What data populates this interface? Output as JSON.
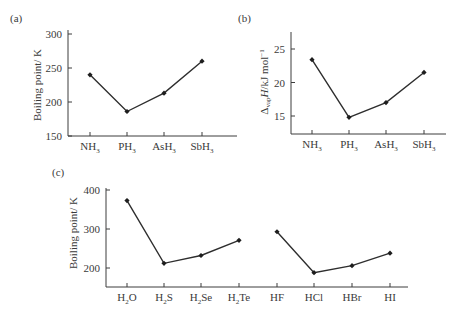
{
  "chart_data": [
    {
      "panel": "(a)",
      "type": "line",
      "categories": [
        "NH3",
        "PH3",
        "AsH3",
        "SbH3"
      ],
      "category_labels": [
        {
          "base": "NH",
          "sub": "3"
        },
        {
          "base": "PH",
          "sub": "3"
        },
        {
          "base": "AsH",
          "sub": "3"
        },
        {
          "base": "SbH",
          "sub": "3"
        }
      ],
      "values": [
        240,
        186,
        213,
        260
      ],
      "ylabel": "Boiling point / K",
      "xlabel": "",
      "yticks": [
        "150",
        "200",
        "250",
        "300"
      ],
      "ylim": [
        150,
        300
      ],
      "grid": false,
      "marker": "diamond"
    },
    {
      "panel": "(b)",
      "type": "line",
      "categories": [
        "NH3",
        "PH3",
        "AsH3",
        "SbH3"
      ],
      "category_labels": [
        {
          "base": "NH",
          "sub": "3"
        },
        {
          "base": "PH",
          "sub": "3"
        },
        {
          "base": "AsH",
          "sub": "3"
        },
        {
          "base": "SbH",
          "sub": "3"
        }
      ],
      "values": [
        23.4,
        14.8,
        17.0,
        21.5
      ],
      "ylabel": "ΔvapH / kJ mol⁻¹",
      "ylabel_parts": {
        "delta": "Δ",
        "sub": "vap",
        "H": "H",
        "unit": "/kJ mol",
        "sup": "−1"
      },
      "xlabel": "",
      "yticks": [
        "15",
        "20",
        "25"
      ],
      "ylim": [
        12.5,
        27.5
      ],
      "grid": false,
      "marker": "diamond"
    },
    {
      "panel": "(c)",
      "type": "line",
      "categories": [
        "H2O",
        "H2S",
        "H2Se",
        "H2Te",
        "HF",
        "HCl",
        "HBr",
        "HI"
      ],
      "category_labels": [
        {
          "base": "H",
          "sub": "2",
          "tail": "O"
        },
        {
          "base": "H",
          "sub": "2",
          "tail": "S"
        },
        {
          "base": "H",
          "sub": "2",
          "tail": "Se"
        },
        {
          "base": "H",
          "sub": "2",
          "tail": "Te"
        },
        {
          "base": "HF",
          "sub": "",
          "tail": ""
        },
        {
          "base": "HCl",
          "sub": "",
          "tail": ""
        },
        {
          "base": "HBr",
          "sub": "",
          "tail": ""
        },
        {
          "base": "HI",
          "sub": "",
          "tail": ""
        }
      ],
      "series": [
        {
          "name": "Group 16 hydrides",
          "categories": [
            "H2O",
            "H2S",
            "H2Se",
            "H2Te"
          ],
          "values": [
            373,
            212,
            232,
            271
          ]
        },
        {
          "name": "Group 17 hydrides",
          "categories": [
            "HF",
            "HCl",
            "HBr",
            "HI"
          ],
          "values": [
            293,
            188,
            206,
            238
          ]
        }
      ],
      "ylabel": "Boiling point / K",
      "xlabel": "",
      "yticks": [
        "200",
        "300",
        "400"
      ],
      "ylim": [
        150,
        400
      ],
      "grid": false,
      "marker": "diamond"
    }
  ],
  "panels": {
    "a": {
      "tag": "(a)",
      "ylabel": "Boiling point/ K"
    },
    "b": {
      "tag": "(b)"
    },
    "c": {
      "tag": "(c)",
      "ylabel": "Boiling point/ K"
    }
  }
}
